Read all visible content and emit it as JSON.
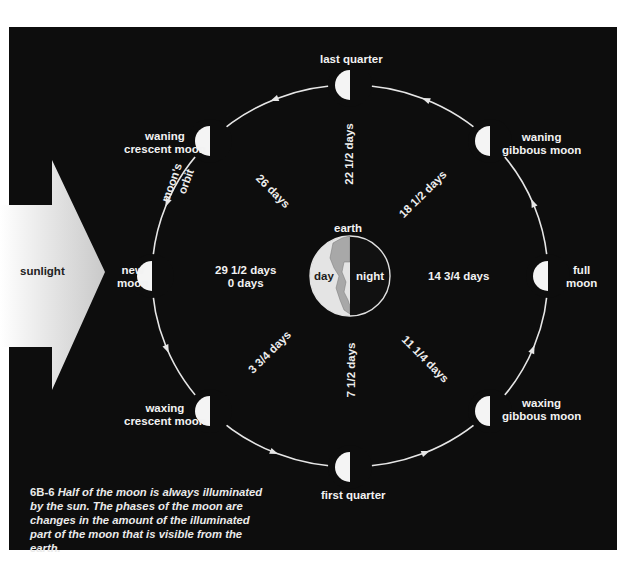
{
  "figure": {
    "id": "6B-6",
    "caption": "Half of the moon is always illuminated by the sun. The phases of the moon are changes in the amount of the illuminated part of the moon that is visible from the earth."
  },
  "sunlight": {
    "label": "sunlight"
  },
  "earth": {
    "label": "earth",
    "day_label": "day",
    "night_label": "night"
  },
  "orbit": {
    "label_line1": "moon's",
    "label_line2": "orbit",
    "direction": "counterclockwise (as viewed)"
  },
  "phases": [
    {
      "key": "new",
      "label_line1": "new",
      "label_line2": "moon"
    },
    {
      "key": "waxing-crescent",
      "label_line1": "waxing",
      "label_line2": "crescent moon"
    },
    {
      "key": "first-quarter",
      "label_line1": "first quarter",
      "label_line2": ""
    },
    {
      "key": "waxing-gibbous",
      "label_line1": "waxing",
      "label_line2": "gibbous moon"
    },
    {
      "key": "full",
      "label_line1": "full",
      "label_line2": "moon"
    },
    {
      "key": "waning-gibbous",
      "label_line1": "waning",
      "label_line2": "gibbous moon"
    },
    {
      "key": "last-quarter",
      "label_line1": "last quarter",
      "label_line2": ""
    },
    {
      "key": "waning-crescent",
      "label_line1": "waning",
      "label_line2": "crescent moon"
    }
  ],
  "day_counts": {
    "new_line1": "29 1/2 days",
    "new_line2": "0 days",
    "waxing_crescent": "3 3/4 days",
    "first_quarter": "7 1/2 days",
    "waxing_gibbous": "11 1/4 days",
    "full": "14 3/4 days",
    "waning_gibbous": "18 1/2 days",
    "last_quarter": "22 1/2 days",
    "waning_crescent": "26 days"
  },
  "colors": {
    "background": "#0d0d0d",
    "orbit": "#e6e6e6",
    "moon_lit": "#f4f4f4",
    "sunlight_light": "#ffffff",
    "sunlight_dark": "#cfcfcf",
    "earth_day": "#e4e4e4",
    "earth_land": "#a9a9a9"
  }
}
